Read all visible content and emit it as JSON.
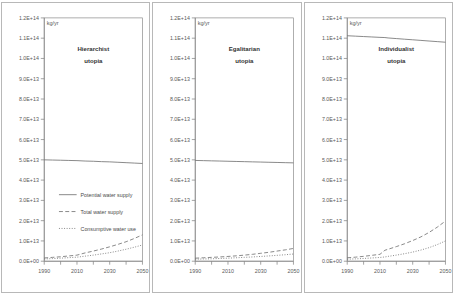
{
  "figure": {
    "unit_label": "kg/yr",
    "x_ticks": [
      "1990",
      "2010",
      "2030",
      "2050"
    ],
    "y_ticks": [
      "1.2E+14",
      "1.1E+14",
      "1.0E+14",
      "9.0E+13",
      "8.0E+13",
      "7.0E+13",
      "6.0E+13",
      "5.0E+13",
      "4.0E+13",
      "3.0E+13",
      "2.0E+13",
      "1.0E+13",
      "0.0E+00"
    ],
    "legend": [
      {
        "label": "Potential water supply",
        "style": "solid"
      },
      {
        "label": "Total water supply",
        "style": "dashed"
      },
      {
        "label": "Consumptive water use",
        "style": "dotted"
      }
    ],
    "panels": [
      {
        "title_line1": "Hierarchist",
        "title_line2": "utopia",
        "name": "hierarchist-utopia-panel"
      },
      {
        "title_line1": "Egalitarian",
        "title_line2": "utopia",
        "name": "egalitarian-utopia-panel"
      },
      {
        "title_line1": "Individualist",
        "title_line2": "utopia",
        "name": "individualist-utopia-panel"
      }
    ]
  },
  "chart_data": [
    {
      "type": "line",
      "title": "Hierarchist utopia",
      "xlabel": "",
      "ylabel": "kg/yr",
      "xlim": [
        1990,
        2050
      ],
      "ylim": [
        0,
        120000000000000.0
      ],
      "grid": false,
      "legend_position": "inside-lower-left",
      "x": [
        1990,
        1995,
        2000,
        2005,
        2010,
        2015,
        2020,
        2025,
        2030,
        2035,
        2040,
        2045,
        2050
      ],
      "series": [
        {
          "name": "Potential water supply",
          "style": "solid",
          "values": [
            50000000000000.0,
            49900000000000.0,
            49800000000000.0,
            49700000000000.0,
            49600000000000.0,
            49400000000000.0,
            49300000000000.0,
            49100000000000.0,
            49000000000000.0,
            48800000000000.0,
            48600000000000.0,
            48400000000000.0,
            48200000000000.0
          ]
        },
        {
          "name": "Total water supply",
          "style": "dashed",
          "values": [
            1600000000000.0,
            1900000000000.0,
            2200000000000.0,
            2600000000000.0,
            3000000000000.0,
            4100000000000.0,
            5000000000000.0,
            6000000000000.0,
            7100000000000.0,
            8300000000000.0,
            9600000000000.0,
            11200000000000.0,
            13000000000000.0
          ]
        },
        {
          "name": "Consumptive water use",
          "style": "dotted",
          "values": [
            1100000000000.0,
            1300000000000.0,
            1500000000000.0,
            1750000000000.0,
            2000000000000.0,
            2500000000000.0,
            3000000000000.0,
            3600000000000.0,
            4200000000000.0,
            5000000000000.0,
            5900000000000.0,
            6900000000000.0,
            8000000000000.0
          ]
        }
      ]
    },
    {
      "type": "line",
      "title": "Egalitarian utopia",
      "xlabel": "",
      "ylabel": "kg/yr",
      "xlim": [
        1990,
        2050
      ],
      "ylim": [
        0,
        120000000000000.0
      ],
      "grid": false,
      "legend_position": "none",
      "x": [
        1990,
        1995,
        2000,
        2005,
        2010,
        2015,
        2020,
        2025,
        2030,
        2035,
        2040,
        2045,
        2050
      ],
      "series": [
        {
          "name": "Potential water supply",
          "style": "solid",
          "values": [
            49700000000000.0,
            49600000000000.0,
            49500000000000.0,
            49400000000000.0,
            49300000000000.0,
            49200000000000.0,
            49100000000000.0,
            49000000000000.0,
            48900000000000.0,
            48800000000000.0,
            48700000000000.0,
            48600000000000.0,
            48500000000000.0
          ]
        },
        {
          "name": "Total water supply",
          "style": "dashed",
          "values": [
            1500000000000.0,
            1700000000000.0,
            1900000000000.0,
            2100000000000.0,
            2350000000000.0,
            2650000000000.0,
            3000000000000.0,
            3400000000000.0,
            3900000000000.0,
            4400000000000.0,
            5000000000000.0,
            5600000000000.0,
            6300000000000.0
          ]
        },
        {
          "name": "Consumptive water use",
          "style": "dotted",
          "values": [
            1000000000000.0,
            1100000000000.0,
            1200000000000.0,
            1350000000000.0,
            1500000000000.0,
            1700000000000.0,
            1900000000000.0,
            2100000000000.0,
            2350000000000.0,
            2600000000000.0,
            2900000000000.0,
            3200000000000.0,
            3550000000000.0
          ]
        }
      ]
    },
    {
      "type": "line",
      "title": "Individualist utopia",
      "xlabel": "",
      "ylabel": "kg/yr",
      "xlim": [
        1990,
        2050
      ],
      "ylim": [
        0,
        120000000000000.0
      ],
      "grid": false,
      "legend_position": "none",
      "x": [
        1990,
        1995,
        2000,
        2005,
        2010,
        2013,
        2015,
        2020,
        2025,
        2030,
        2035,
        2040,
        2045,
        2050
      ],
      "series": [
        {
          "name": "Potential water supply",
          "style": "solid",
          "values": [
            111200000000000.0,
            111000000000000.0,
            110800000000000.0,
            110600000000000.0,
            110400000000000.0,
            110300000000000.0,
            110100000000000.0,
            109800000000000.0,
            109500000000000.0,
            109200000000000.0,
            108900000000000.0,
            108600000000000.0,
            108300000000000.0,
            108000000000000.0
          ]
        },
        {
          "name": "Total water supply",
          "style": "dashed",
          "values": [
            1700000000000.0,
            2000000000000.0,
            2400000000000.0,
            2900000000000.0,
            3400000000000.0,
            5400000000000.0,
            5900000000000.0,
            7200000000000.0,
            8600000000000.0,
            10200000000000.0,
            12000000000000.0,
            14200000000000.0,
            16800000000000.0,
            19800000000000.0
          ]
        },
        {
          "name": "Consumptive water use",
          "style": "dotted",
          "values": [
            1000000000000.0,
            1150000000000.0,
            1350000000000.0,
            1600000000000.0,
            1850000000000.0,
            2100000000000.0,
            2400000000000.0,
            3000000000000.0,
            3700000000000.0,
            4500000000000.0,
            5500000000000.0,
            6700000000000.0,
            8200000000000.0,
            10000000000000.0
          ]
        }
      ]
    }
  ]
}
